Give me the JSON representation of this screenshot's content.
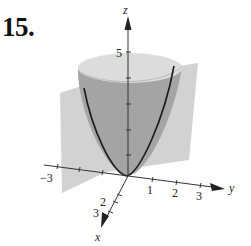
{
  "problem": {
    "number": "15."
  },
  "figure": {
    "axes": {
      "z": {
        "label": "z",
        "ticks": [
          "5"
        ]
      },
      "y": {
        "label": "y",
        "ticks": [
          "1",
          "2",
          "3"
        ]
      },
      "x": {
        "label": "x",
        "ticks": [
          "2",
          "3"
        ]
      },
      "neg_label": "−3"
    },
    "colors": {
      "plane": "#c8c8c8",
      "paraboloid_outer": "#9a9a9a",
      "paraboloid_rim": "#d6d6d6",
      "curve": "#1a1a1a",
      "axis": "#333333"
    }
  }
}
